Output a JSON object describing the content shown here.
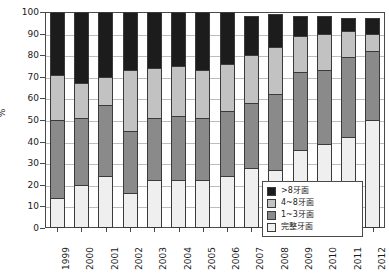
{
  "chart_data": {
    "type": "bar",
    "subtype": "stacked-bar-100",
    "title": "",
    "xlabel": "",
    "ylabel": "%",
    "ylim": [
      0,
      100
    ],
    "ytick_step": 10,
    "yticks": [
      0,
      10,
      20,
      30,
      40,
      50,
      60,
      70,
      80,
      90,
      100
    ],
    "grid": true,
    "grid_axis": "y",
    "legend_position": "bottom-right",
    "categories": [
      "1999",
      "2000",
      "2001",
      "2002",
      "2003",
      "2004",
      "2005",
      "2006",
      "2007",
      "2008",
      "2009",
      "2010",
      "2011",
      "2012"
    ],
    "series": [
      {
        "name": "完整牙面",
        "color": "#efefef",
        "values": [
          14,
          20,
          24,
          16,
          22,
          22,
          22,
          24,
          28,
          27,
          36,
          39,
          42,
          50
        ]
      },
      {
        "name": "1~3牙面",
        "color": "#8a8a8a",
        "values": [
          36,
          31,
          33,
          29,
          29,
          30,
          29,
          30,
          30,
          35,
          36,
          34,
          37,
          32
        ]
      },
      {
        "name": "4~8牙面",
        "color": "#c2c2c2",
        "values": [
          21,
          16,
          13,
          28,
          23,
          23,
          22,
          22,
          22,
          22,
          17,
          17,
          12,
          8
        ]
      },
      {
        "name": ">8牙面",
        "color": "#1c1c1c",
        "values": [
          29,
          33,
          30,
          27,
          26,
          25,
          27,
          24,
          18,
          15,
          9,
          8,
          6,
          7
        ]
      }
    ],
    "cumulative_tops": [
      [
        14,
        50,
        71,
        100
      ],
      [
        20,
        51,
        67,
        100
      ],
      [
        24,
        57,
        70,
        100
      ],
      [
        16,
        45,
        73,
        100
      ],
      [
        22,
        51,
        74,
        100
      ],
      [
        22,
        52,
        75,
        100
      ],
      [
        22,
        51,
        73,
        100
      ],
      [
        24,
        54,
        76,
        100
      ],
      [
        28,
        58,
        80,
        98
      ],
      [
        27,
        62,
        84,
        99
      ],
      [
        36,
        72,
        89,
        98
      ],
      [
        39,
        73,
        90,
        98
      ],
      [
        42,
        79,
        91,
        97
      ],
      [
        50,
        82,
        90,
        97
      ]
    ]
  },
  "legend": {
    "entries": [
      {
        "label": ">8牙面",
        "color": "#1c1c1c"
      },
      {
        "label": "4~8牙面",
        "color": "#c2c2c2"
      },
      {
        "label": "1~3牙面",
        "color": "#8a8a8a"
      },
      {
        "label": "完整牙面",
        "color": "#efefef"
      }
    ]
  },
  "axis": {
    "y_title": "%",
    "y_tick_labels": [
      "0",
      "10",
      "20",
      "30",
      "40",
      "50",
      "60",
      "70",
      "80",
      "90",
      "100"
    ],
    "x_tick_labels": [
      "1999",
      "2000",
      "2001",
      "2002",
      "2003",
      "2004",
      "2005",
      "2006",
      "2007",
      "2008",
      "2009",
      "2010",
      "2011",
      "2012"
    ]
  },
  "colors": {
    "axis": "#4a4a4a",
    "grid": "#bdbdbd",
    "text": "#1a1a1a",
    "background": "#ffffff"
  }
}
